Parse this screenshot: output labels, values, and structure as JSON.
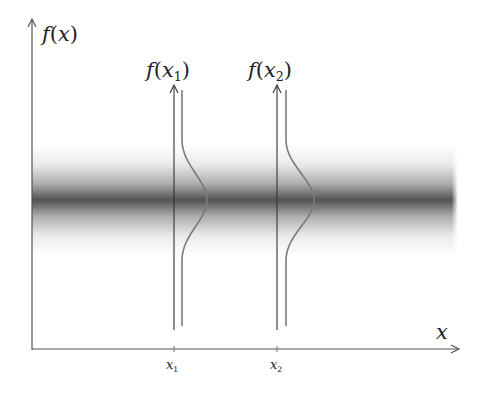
{
  "diagram": {
    "y_axis_label": {
      "fn": "f",
      "arg": "x"
    },
    "x_axis_label": "x",
    "band": {
      "color": "#4a4a4a",
      "center_y": 200,
      "x_start": 32,
      "x_end": 457
    },
    "samples": [
      {
        "id": "x1",
        "var": "x",
        "sub": "1",
        "fn_label_fn": "f",
        "fn_label_var": "x",
        "fn_label_sub": "1",
        "x": 174
      },
      {
        "id": "x2",
        "var": "x",
        "sub": "2",
        "fn_label_fn": "f",
        "fn_label_var": "x",
        "fn_label_sub": "2",
        "x": 277
      }
    ],
    "colors": {
      "axis": "#555555",
      "curve": "#7a7a7a",
      "band_core": "#4a4a4a"
    }
  }
}
